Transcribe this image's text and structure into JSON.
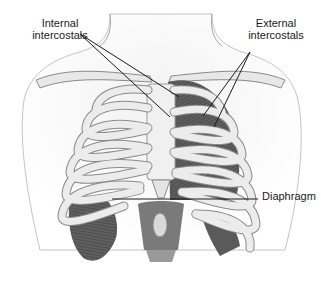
{
  "figure": {
    "labels": {
      "internal": {
        "line1": "Internal",
        "line2": "intercostals"
      },
      "external": {
        "line1": "External",
        "line2": "intercostals"
      },
      "diaphragm": {
        "text": "Diaphragm"
      }
    },
    "colors": {
      "background": "#ffffff",
      "bone": "#e6e6e6",
      "bone_outline": "#8a8a8a",
      "muscle": "#5c5c5c",
      "skin_outline": "#b5b5b5",
      "leader_line": "#1a1a1a",
      "text": "#1a1a1a"
    }
  }
}
